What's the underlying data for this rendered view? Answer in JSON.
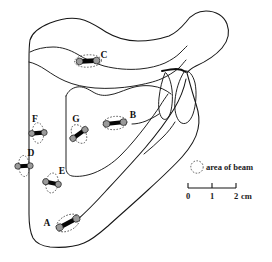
{
  "figure": {
    "type": "anatomical-line-drawing",
    "sites": [
      {
        "id": "A",
        "label": "A",
        "label_x": 47,
        "label_y": 226,
        "beam_cx": 68,
        "beam_cy": 223,
        "beam_rx": 12.5,
        "beam_ry": 7.5,
        "beam_rot": -28,
        "marker_rot": -28,
        "marker_len": 19,
        "marker_w": 4.6
      },
      {
        "id": "B",
        "label": "B",
        "label_x": 133,
        "label_y": 118,
        "beam_cx": 115,
        "beam_cy": 123,
        "beam_rx": 12.0,
        "beam_ry": 6.6,
        "beam_rot": -6,
        "marker_rot": -6,
        "marker_len": 17,
        "marker_w": 4.2
      },
      {
        "id": "C",
        "label": "C",
        "label_x": 104,
        "label_y": 58,
        "beam_cx": 88,
        "beam_cy": 61,
        "beam_rx": 13.5,
        "beam_ry": 6.2,
        "beam_rot": -3,
        "marker_rot": -3,
        "marker_len": 17,
        "marker_w": 4.6
      },
      {
        "id": "D",
        "label": "D",
        "label_x": 31,
        "label_y": 156,
        "beam_cx": 24,
        "beam_cy": 166,
        "beam_rx": 5.4,
        "beam_ry": 10.5,
        "beam_rot": -4,
        "marker_rot": -2,
        "marker_len": 13,
        "marker_w": 4.0
      },
      {
        "id": "E",
        "label": "E",
        "label_x": 62,
        "label_y": 174,
        "beam_cx": 52,
        "beam_cy": 183,
        "beam_rx": 6.2,
        "beam_ry": 10.0,
        "beam_rot": 8,
        "marker_rot": 12,
        "marker_len": 13.5,
        "marker_w": 4.2
      },
      {
        "id": "F",
        "label": "F",
        "label_x": 35,
        "label_y": 122,
        "beam_cx": 38,
        "beam_cy": 133,
        "beam_rx": 5.8,
        "beam_ry": 10.2,
        "beam_rot": -2,
        "marker_rot": -4,
        "marker_len": 13,
        "marker_w": 4.4
      },
      {
        "id": "G",
        "label": "G",
        "label_x": 76,
        "label_y": 122,
        "beam_cx": 79,
        "beam_cy": 134,
        "beam_rx": 6.6,
        "beam_ry": 10.2,
        "beam_rot": -32,
        "marker_rot": -36,
        "marker_len": 15,
        "marker_w": 4.4
      }
    ],
    "legend": {
      "label": "area of beam",
      "circle_cx": 197,
      "circle_cy": 167,
      "circle_r": 6.2,
      "text_x": 206,
      "text_y": 170
    },
    "scale": {
      "ticks": [
        "0",
        "1",
        "2"
      ],
      "unit": "cm",
      "x_start": 188,
      "x_end": 236,
      "y": 188,
      "tick_height": 5,
      "label_y": 199,
      "unit_x": 240,
      "unit_y": 199
    },
    "colors": {
      "outline": "#161616",
      "beam_dash": "#3a3a3a",
      "marker_bar": "#050505",
      "marker_end": "#9a9a9a",
      "text": "#111111",
      "background": "#ffffff"
    }
  }
}
